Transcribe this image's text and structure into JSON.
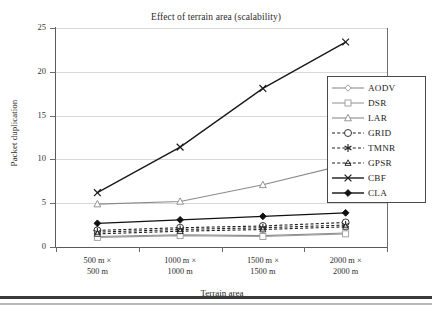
{
  "chart_data": {
    "type": "line",
    "title": "Effect of terrain area (scalability)",
    "xlabel": "Terrain area",
    "ylabel": "Packet duplication",
    "categories": [
      "500 m ×\n500 m",
      "1000 m ×\n1000 m",
      "1500 m ×\n1500 m",
      "2000 m ×\n2000 m"
    ],
    "category_lines": [
      [
        "500 m ×",
        "500 m"
      ],
      [
        "1000 m ×",
        "1000 m"
      ],
      [
        "1500 m ×",
        "1500 m"
      ],
      [
        "2000 m ×",
        "2000 m"
      ]
    ],
    "ylim": [
      0,
      25
    ],
    "yticks": [
      0,
      5,
      10,
      15,
      20,
      25
    ],
    "ytick_labels": [
      "0",
      "5",
      "10",
      "15",
      "20",
      "25"
    ],
    "grid": true,
    "legend_position": "right",
    "series": [
      {
        "name": "AODV",
        "marker": "diamond-open",
        "line": "solid",
        "color": "#8d8d8d",
        "values": [
          1.2,
          1.4,
          1.3,
          1.6
        ]
      },
      {
        "name": "DSR",
        "marker": "square-open",
        "line": "solid",
        "color": "#9a9a9a",
        "values": [
          1.1,
          1.3,
          1.2,
          1.5
        ]
      },
      {
        "name": "LAR",
        "marker": "triangle-open",
        "line": "solid",
        "color": "#8a8a8a",
        "values": [
          4.9,
          5.2,
          7.1,
          9.4
        ]
      },
      {
        "name": "GRID",
        "marker": "circle-open",
        "line": "dashed",
        "color": "#1f1f1f",
        "values": [
          1.9,
          2.2,
          2.4,
          2.8
        ]
      },
      {
        "name": "TMNR",
        "marker": "asterisk",
        "line": "dashed",
        "color": "#1f1f1f",
        "values": [
          1.7,
          2.0,
          2.2,
          2.5
        ]
      },
      {
        "name": "GPSR",
        "marker": "triangle-open-small",
        "line": "dashed",
        "color": "#1f1f1f",
        "values": [
          1.5,
          1.8,
          2.0,
          2.3
        ]
      },
      {
        "name": "CBF",
        "marker": "x",
        "line": "solid",
        "color": "#1a1a1a",
        "values": [
          6.2,
          11.4,
          18.1,
          23.4
        ]
      },
      {
        "name": "CLA",
        "marker": "diamond-filled",
        "line": "solid",
        "color": "#111111",
        "values": [
          2.7,
          3.1,
          3.5,
          3.9
        ]
      }
    ]
  },
  "legend": {
    "items": [
      {
        "label": "AODV"
      },
      {
        "label": "DSR"
      },
      {
        "label": "LAR"
      },
      {
        "label": "GRID"
      },
      {
        "label": "TMNR"
      },
      {
        "label": "GPSR"
      },
      {
        "label": "CBF"
      },
      {
        "label": "CLA"
      }
    ]
  }
}
